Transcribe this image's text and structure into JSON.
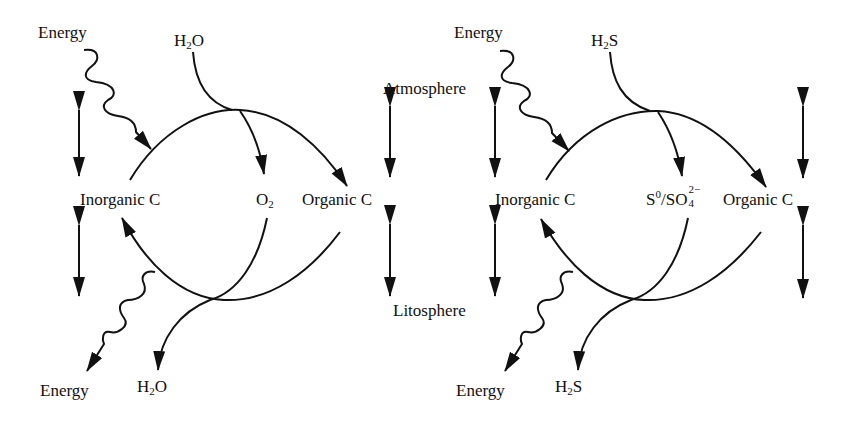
{
  "figure": {
    "stroke_color": "#111111",
    "background": "#ffffff"
  },
  "center_labels": {
    "top": "Atmosphere",
    "bottom": "Litosphere"
  },
  "left_panel": {
    "energy_in": "Energy",
    "donor_in": {
      "base": "H",
      "sub": "2",
      "tail": "O"
    },
    "inorganic": "Inorganic C",
    "product": {
      "base": "O",
      "sub": "2"
    },
    "organic": "Organic C",
    "energy_out": "Energy",
    "donor_out": {
      "base": "H",
      "sub": "2",
      "tail": "O"
    }
  },
  "right_panel": {
    "energy_in": "Energy",
    "donor_in": {
      "base": "H",
      "sub": "2",
      "tail": "S"
    },
    "inorganic": "Inorganic C",
    "product": {
      "s": "S",
      "s_sup": "0",
      "slash": "/SO",
      "so_sub": "4",
      "so_sup": "2−"
    },
    "organic": "Organic C",
    "energy_out": "Energy",
    "donor_out": {
      "base": "H",
      "sub": "2",
      "tail": "S"
    }
  }
}
